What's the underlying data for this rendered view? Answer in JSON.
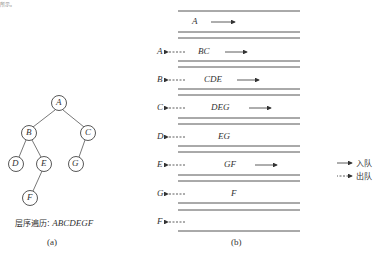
{
  "top_fragment": "所示。",
  "tree": {
    "nodes": [
      {
        "id": "A",
        "x": 59,
        "y": 103
      },
      {
        "id": "B",
        "x": 29,
        "y": 133
      },
      {
        "id": "C",
        "x": 88,
        "y": 133
      },
      {
        "id": "D",
        "x": 16,
        "y": 164
      },
      {
        "id": "E",
        "x": 44,
        "y": 164
      },
      {
        "id": "G",
        "x": 76,
        "y": 164
      },
      {
        "id": "F",
        "x": 30,
        "y": 198
      }
    ],
    "edges": [
      [
        "A",
        "B"
      ],
      [
        "A",
        "C"
      ],
      [
        "B",
        "D"
      ],
      [
        "B",
        "E"
      ],
      [
        "C",
        "G"
      ],
      [
        "E",
        "F"
      ]
    ],
    "traversal_label": "层序遍历: ",
    "traversal_value": "ABCDEGF",
    "caption": "(a)"
  },
  "queue": {
    "caption": "(b)",
    "rows": [
      {
        "dequeued": "",
        "content": "A"
      },
      {
        "dequeued": "A",
        "content": "BC"
      },
      {
        "dequeued": "B",
        "content": "CDE"
      },
      {
        "dequeued": "C",
        "content": "DEG"
      },
      {
        "dequeued": "D",
        "content": "EG"
      },
      {
        "dequeued": "E",
        "content": "GF"
      },
      {
        "dequeued": "G",
        "content": "F"
      },
      {
        "dequeued": "F",
        "content": ""
      }
    ]
  },
  "legend": {
    "enqueue": "入队",
    "dequeue": "出队"
  }
}
